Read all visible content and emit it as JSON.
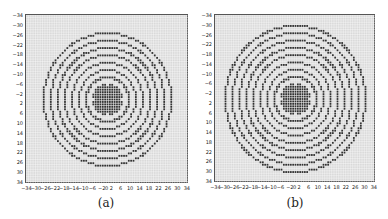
{
  "figure": {
    "panels": [
      {
        "caption": "(a)",
        "type": "circular-grid-pattern",
        "distance_mode": "euclidean"
      },
      {
        "caption": "(b)",
        "type": "circular-grid-pattern",
        "distance_mode": "chebyshev-ring"
      }
    ],
    "axis_ticks_y": [
      "−34",
      "−30",
      "−26",
      "−22",
      "−18",
      "−14",
      "−10",
      "−6",
      "−2",
      "2",
      "6",
      "10",
      "14",
      "18",
      "22",
      "26",
      "30",
      "34"
    ],
    "axis_ticks_x": [
      "−34",
      "−30",
      "−26",
      "−22",
      "−18",
      "−14",
      "−10",
      "−6",
      "−2",
      "0",
      "2",
      "6",
      "10",
      "14",
      "18",
      "22",
      "26",
      "30",
      "34"
    ],
    "grid_range": [
      -34,
      34
    ],
    "colors": {
      "background": "#d9d9d9",
      "grid": "#ffffff",
      "marker": "#333333"
    }
  }
}
